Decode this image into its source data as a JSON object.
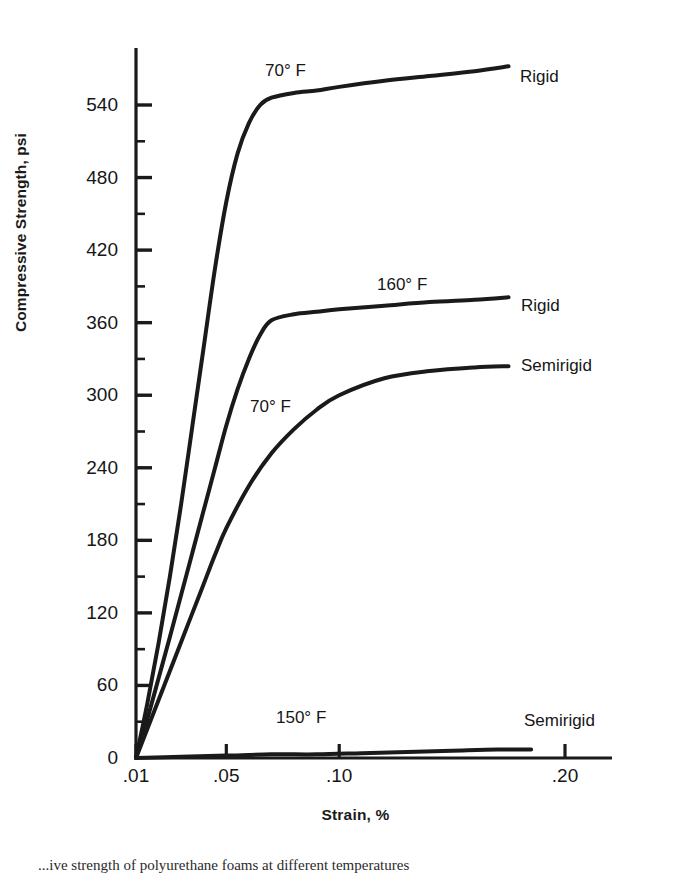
{
  "figure": {
    "caption": "...ive strength of polyurethane foams at different temperatures"
  },
  "chart_data": {
    "type": "line",
    "title": "",
    "xlabel": "Strain, %",
    "ylabel": "Compressive Strength, psi",
    "xlim": [
      0.0,
      0.225
    ],
    "ylim": [
      0,
      570
    ],
    "grid": false,
    "legend_position": "inline-right-of-curve",
    "x_ticks": [
      {
        "value": 0.01,
        "label": ".01"
      },
      {
        "value": 0.05,
        "label": ".05"
      },
      {
        "value": 0.1,
        "label": ".10"
      },
      {
        "value": 0.2,
        "label": ".20"
      }
    ],
    "y_ticks": [
      {
        "value": 0,
        "label": "0"
      },
      {
        "value": 60,
        "label": "60"
      },
      {
        "value": 120,
        "label": "120"
      },
      {
        "value": 180,
        "label": "180"
      },
      {
        "value": 240,
        "label": "240"
      },
      {
        "value": 300,
        "label": "300"
      },
      {
        "value": 360,
        "label": "360"
      },
      {
        "value": 420,
        "label": "420"
      },
      {
        "value": 480,
        "label": "480"
      },
      {
        "value": 540,
        "label": "540"
      }
    ],
    "y_minor_tick_interval": 30,
    "series": [
      {
        "name": "Rigid, 70° F",
        "material": "Rigid",
        "temperature": "70° F",
        "end_label": "Rigid",
        "temp_label": "70° F",
        "x": [
          0.01,
          0.015,
          0.02,
          0.025,
          0.03,
          0.035,
          0.04,
          0.045,
          0.05,
          0.055,
          0.06,
          0.065,
          0.07,
          0.08,
          0.09,
          0.1,
          0.12,
          0.14,
          0.16,
          0.175
        ],
        "y": [
          0,
          45,
          95,
          150,
          210,
          275,
          340,
          405,
          460,
          500,
          525,
          540,
          546,
          550,
          552,
          555,
          560,
          564,
          568,
          572
        ]
      },
      {
        "name": "Rigid, 160° F",
        "material": "Rigid",
        "temperature": "160° F",
        "end_label": "Rigid",
        "temp_label": "160° F",
        "x": [
          0.01,
          0.015,
          0.02,
          0.025,
          0.03,
          0.035,
          0.04,
          0.045,
          0.05,
          0.055,
          0.06,
          0.065,
          0.07,
          0.08,
          0.09,
          0.1,
          0.12,
          0.14,
          0.16,
          0.175
        ],
        "y": [
          0,
          32,
          66,
          100,
          135,
          170,
          205,
          240,
          275,
          305,
          330,
          350,
          362,
          367,
          369,
          371,
          374,
          377,
          379,
          381
        ]
      },
      {
        "name": "Semirigid, 70° F",
        "material": "Semirigid",
        "temperature": "70° F",
        "end_label": "Semirigid",
        "temp_label": "70° F",
        "x": [
          0.01,
          0.015,
          0.02,
          0.025,
          0.03,
          0.035,
          0.04,
          0.045,
          0.05,
          0.06,
          0.07,
          0.08,
          0.09,
          0.1,
          0.12,
          0.14,
          0.16,
          0.175
        ],
        "y": [
          0,
          24,
          48,
          72,
          96,
          120,
          144,
          168,
          190,
          225,
          252,
          272,
          288,
          300,
          314,
          320,
          323,
          324
        ]
      },
      {
        "name": "Semirigid, 150° F",
        "material": "Semirigid",
        "temperature": "150° F",
        "end_label": "Semirigid",
        "temp_label": "150° F",
        "x": [
          0.01,
          0.03,
          0.05,
          0.07,
          0.09,
          0.11,
          0.13,
          0.15,
          0.17,
          0.185
        ],
        "y": [
          0,
          1,
          2,
          3,
          3,
          4,
          5,
          6,
          7,
          7
        ]
      }
    ],
    "annotations": [
      {
        "text": "70° F",
        "x_px": 265,
        "y_px": 62,
        "name": "annot-rigid-70f-temp"
      },
      {
        "text": "Rigid",
        "x_px": 520,
        "y_px": 68,
        "name": "annot-rigid-70f-material"
      },
      {
        "text": "160° F",
        "x_px": 377,
        "y_px": 276,
        "name": "annot-rigid-160f-temp"
      },
      {
        "text": "Rigid",
        "x_px": 521,
        "y_px": 297,
        "name": "annot-rigid-160f-material"
      },
      {
        "text": "Semirigid",
        "x_px": 521,
        "y_px": 357,
        "name": "annot-semirigid-70f-material"
      },
      {
        "text": "70° F",
        "x_px": 250,
        "y_px": 398,
        "name": "annot-semirigid-70f-temp"
      },
      {
        "text": "150° F",
        "x_px": 276,
        "y_px": 709,
        "name": "annot-semirigid-150f-temp"
      },
      {
        "text": "Semirigid",
        "x_px": 524,
        "y_px": 712,
        "name": "annot-semirigid-150f-material"
      }
    ],
    "colors": {
      "curve": "#1a1a1a",
      "axis": "#1a1a1a",
      "text": "#161616",
      "background": "#ffffff"
    }
  }
}
